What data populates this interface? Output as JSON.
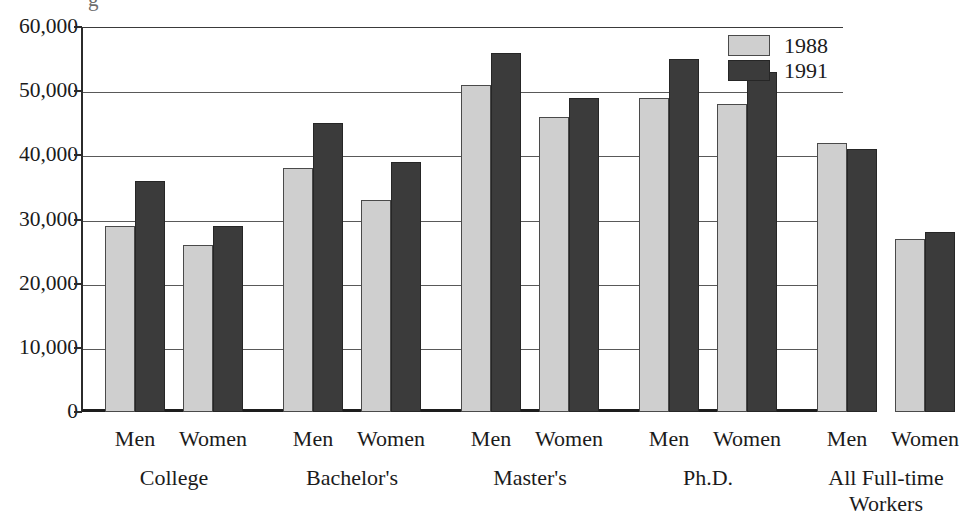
{
  "chart_data": {
    "type": "bar",
    "title": "",
    "xlabel": "",
    "ylabel": "",
    "ylim": [
      0,
      60000
    ],
    "yticks": [
      "0",
      "10,000",
      "20,000",
      "30,000",
      "40,000",
      "50,000",
      "60,000"
    ],
    "ytick_values": [
      0,
      10000,
      20000,
      30000,
      40000,
      50000,
      60000
    ],
    "grid": true,
    "legend_position": "top-right",
    "categories": [
      "College - Men",
      "College - Women",
      "Bachelor's - Men",
      "Bachelor's - Women",
      "Master's - Men",
      "Master's - Women",
      "Ph.D. - Men",
      "Ph.D. - Women",
      "All Full-time Workers - Men",
      "All Full-time Workers - Women"
    ],
    "series": [
      {
        "name": "1988",
        "color": "#cfcfcf",
        "values": [
          29000,
          26000,
          38000,
          33000,
          51000,
          46000,
          49000,
          48000,
          42000,
          27000
        ]
      },
      {
        "name": "1991",
        "color": "#3b3b3b",
        "values": [
          36000,
          29000,
          45000,
          39000,
          56000,
          49000,
          55000,
          53000,
          41000,
          28000
        ]
      }
    ],
    "groups": [
      {
        "label": "College",
        "subgroups": [
          {
            "label": "Men",
            "v1988": 29000,
            "v1991": 36000
          },
          {
            "label": "Women",
            "v1988": 26000,
            "v1991": 29000
          }
        ]
      },
      {
        "label": "Bachelor's",
        "subgroups": [
          {
            "label": "Men",
            "v1988": 38000,
            "v1991": 45000
          },
          {
            "label": "Women",
            "v1988": 33000,
            "v1991": 39000
          }
        ]
      },
      {
        "label": "Master's",
        "subgroups": [
          {
            "label": "Men",
            "v1988": 51000,
            "v1991": 56000
          },
          {
            "label": "Women",
            "v1988": 46000,
            "v1991": 49000
          }
        ]
      },
      {
        "label": "Ph.D.",
        "subgroups": [
          {
            "label": "Men",
            "v1988": 49000,
            "v1991": 55000
          },
          {
            "label": "Women",
            "v1988": 48000,
            "v1991": 53000
          }
        ]
      },
      {
        "label": "All Full-time Workers",
        "label_lines": [
          "All Full-time",
          "Workers"
        ],
        "subgroups": [
          {
            "label": "Men",
            "v1988": 42000,
            "v1991": 41000
          },
          {
            "label": "Women",
            "v1988": 27000,
            "v1991": 28000
          }
        ]
      }
    ]
  },
  "legend": {
    "entries": [
      {
        "label": "1988",
        "color": "#cfcfcf"
      },
      {
        "label": "1991",
        "color": "#3b3b3b"
      }
    ]
  },
  "cropped_title_fragment": "g"
}
